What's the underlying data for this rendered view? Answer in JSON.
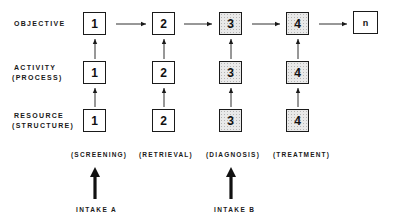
{
  "rows": [
    {
      "label_line1": "OBJECTIVE",
      "label_line2": ""
    },
    {
      "label_line1": "ACTIVITY",
      "label_line2": "(PROCESS)"
    },
    {
      "label_line1": "RESOURCE",
      "label_line2": "(STRUCTURE)"
    }
  ],
  "boxes": {
    "objective": [
      "1",
      "2",
      "3",
      "4",
      "n"
    ],
    "activity": [
      "1",
      "2",
      "3",
      "4"
    ],
    "resource": [
      "1",
      "2",
      "3",
      "4"
    ]
  },
  "stages": [
    "(SCREENING)",
    "(RETRIEVAL)",
    "(DIAGNOSIS)",
    "(TREATMENT)"
  ],
  "intakes": [
    {
      "label": "INTAKE A",
      "stage": "(SCREENING)"
    },
    {
      "label": "INTAKE B",
      "stage": "(DIAGNOSIS)"
    }
  ],
  "colors": {
    "line": "#1a1a1a",
    "shaded_fill": "#e9e9e9"
  }
}
